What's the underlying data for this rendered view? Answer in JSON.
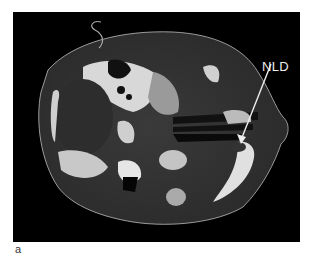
{
  "figure": {
    "panel_label": "a",
    "annotation": {
      "label": "NLD",
      "color": "#eeeeee"
    },
    "background": "#000000"
  }
}
